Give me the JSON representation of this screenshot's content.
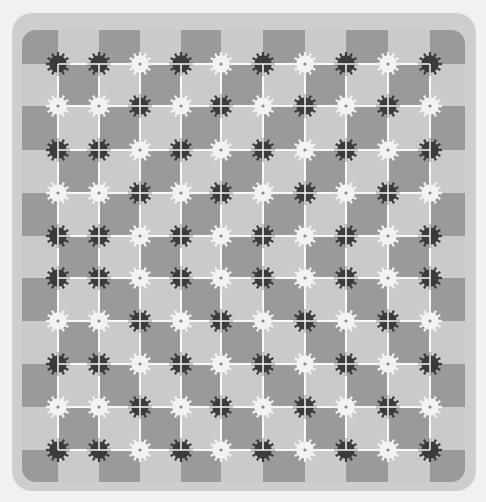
{
  "colors": {
    "page_bg": "#f1f1f1",
    "board_bg": "#cecece",
    "dark_cell": "#9a9a9a",
    "light_cell": "#cacaca",
    "grid_line": "#fafafa",
    "dark_gear": "#3b3b3b",
    "light_gear": "#f3f3f3",
    "light_gear_hub": "#8a8a8a"
  },
  "board": {
    "x": 12,
    "y": 13,
    "width": 464,
    "height": 478,
    "radius": 20
  },
  "grid": {
    "x_lines": [
      58,
      99,
      140,
      181,
      221,
      263,
      305,
      346,
      388,
      430
    ],
    "y_lines": [
      64,
      106,
      150,
      193,
      236,
      278,
      321,
      364,
      407,
      450
    ],
    "x_edges": [
      22,
      465
    ],
    "y_edges": [
      30,
      482
    ]
  },
  "gears": {
    "radius": 12,
    "teeth": 12,
    "pattern": [
      "DDLDLDLDLD",
      "LLDLDLDLDL",
      "DDLDLDLDLD",
      "LLDLDLDLDL",
      "DDLDLDLDLD",
      "DDLDLDLDLD",
      "LLDLDLDLDL",
      "DDLDLDLDLD",
      "LLDLDLDLDL",
      "DDLDLDLDLD"
    ]
  }
}
